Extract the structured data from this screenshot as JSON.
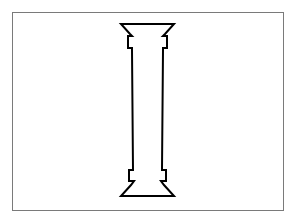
{
  "figure": {
    "stroke_color": "#000000",
    "fill_color": "#ffffff",
    "frame_color": "#7a7a7a",
    "background_color": "#ffffff"
  }
}
